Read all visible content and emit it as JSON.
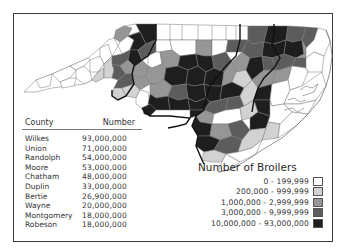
{
  "table": {
    "headers": {
      "county": "County",
      "number": "Number"
    },
    "rows": [
      {
        "county": "Wilkes",
        "number": "93,000,000"
      },
      {
        "county": "Union",
        "number": "71,000,000"
      },
      {
        "county": "Randolph",
        "number": "54,000,000"
      },
      {
        "county": "Moore",
        "number": "53,000,000"
      },
      {
        "county": "Chatham",
        "number": "48,000,000"
      },
      {
        "county": "Duplin",
        "number": "33,000,000"
      },
      {
        "county": "Bertie",
        "number": "26,900,000"
      },
      {
        "county": "Wayne",
        "number": "20,000,000"
      },
      {
        "county": "Montgomery",
        "number": "18,000,000"
      },
      {
        "county": "Robeson",
        "number": "18,000,000"
      }
    ]
  },
  "legend": {
    "title": "Number of Broilers",
    "items": [
      {
        "label": "0 - 199,999",
        "color": "#ffffff"
      },
      {
        "label": "200,000 - 999,999",
        "color": "#d2d2d2"
      },
      {
        "label": "1,000,000 - 2,999,999",
        "color": "#969696"
      },
      {
        "label": "3,000,000 - 9,999,999",
        "color": "#5c5c5c"
      },
      {
        "label": "10,000,000 - 93,000,000",
        "color": "#1e1e1e"
      }
    ]
  },
  "map": {
    "region": "North Carolina",
    "subject": "Broiler production by county"
  }
}
